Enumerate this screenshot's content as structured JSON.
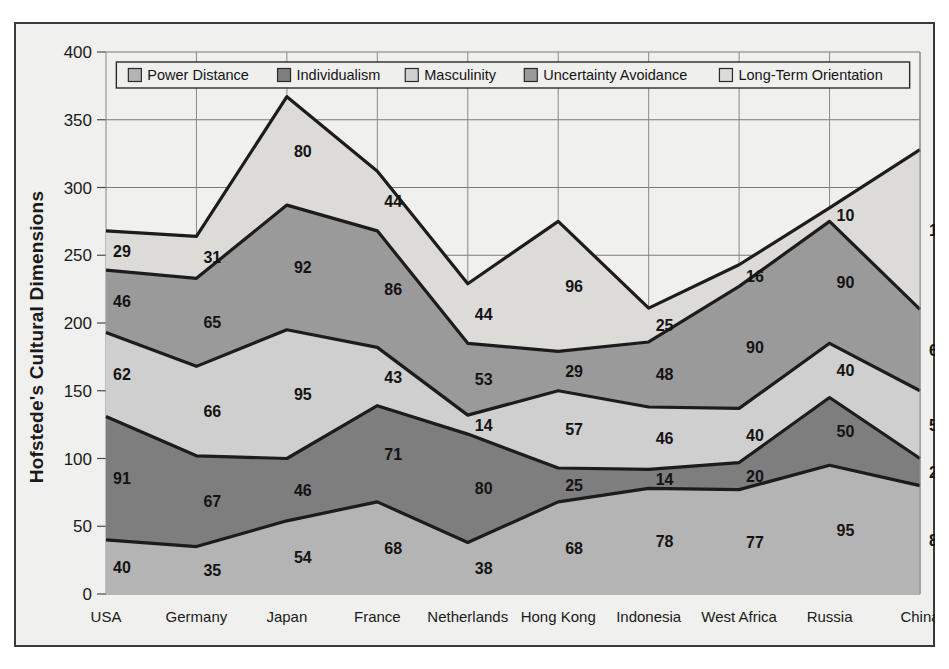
{
  "chart_data": {
    "type": "area",
    "stacked": true,
    "title": "",
    "ylabel": "Hofstede's Cultural Dimensions",
    "xlabel": "",
    "ylim": [
      0,
      400
    ],
    "ytick_step": 50,
    "yticks": [
      0,
      50,
      100,
      150,
      200,
      250,
      300,
      350,
      400
    ],
    "grid": true,
    "legend_position": "top-inside",
    "categories": [
      "USA",
      "Germany",
      "Japan",
      "France",
      "Netherlands",
      "Hong Kong",
      "Indonesia",
      "West Africa",
      "Russia",
      "China"
    ],
    "series": [
      {
        "name": "Power Distance",
        "color": "#b4b4b4",
        "values": [
          40,
          35,
          54,
          68,
          38,
          68,
          78,
          77,
          95,
          80
        ]
      },
      {
        "name": "Individualism",
        "color": "#7e7e7e",
        "values": [
          91,
          67,
          46,
          71,
          80,
          25,
          14,
          20,
          50,
          20
        ]
      },
      {
        "name": "Masculinity",
        "color": "#cfcfcf",
        "values": [
          62,
          66,
          95,
          43,
          14,
          57,
          46,
          40,
          40,
          50
        ]
      },
      {
        "name": "Uncertainty Avoidance",
        "color": "#9a9a9a",
        "values": [
          46,
          65,
          92,
          86,
          53,
          29,
          48,
          90,
          90,
          60
        ]
      },
      {
        "name": "Long-Term Orientation",
        "color": "#dddbd8",
        "values": [
          29,
          31,
          80,
          44,
          44,
          96,
          25,
          16,
          10,
          118
        ]
      }
    ],
    "totals": [
      268,
      264,
      367,
      312,
      229,
      275,
      211,
      243,
      285,
      328
    ]
  }
}
